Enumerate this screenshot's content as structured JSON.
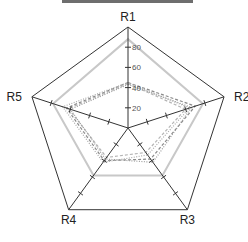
{
  "chart_data": {
    "type": "radar",
    "title": "",
    "axes": [
      "R1",
      "R2",
      "R3",
      "R4",
      "R5"
    ],
    "rlim": [
      0,
      100
    ],
    "ticks": [
      20,
      40,
      60,
      80
    ],
    "tick_labels": [
      "20",
      "40",
      "60",
      "80"
    ],
    "grid": false,
    "legend": "none visible",
    "series": [
      {
        "name": "series-1",
        "style": "solid",
        "color": "#c8c8c8",
        "values": [
          88,
          78,
          58,
          58,
          78
        ]
      },
      {
        "name": "series-2",
        "style": "dashed",
        "color": "#8a8a8a",
        "values": [
          45,
          70,
          38,
          40,
          64
        ]
      },
      {
        "name": "series-3",
        "style": "dotted",
        "color": "#aaaaaa",
        "values": [
          45,
          64,
          33,
          42,
          68
        ]
      },
      {
        "name": "series-4",
        "style": "dashed",
        "color": "#b5b5b5",
        "values": [
          44,
          60,
          30,
          36,
          62
        ]
      },
      {
        "name": "series-5",
        "style": "dotted",
        "color": "#9a9a9a",
        "values": [
          43,
          66,
          42,
          38,
          60
        ]
      }
    ]
  },
  "colors": {
    "axis": "#333333",
    "outer": "#333333",
    "title_bar": "#6e6e6e"
  }
}
